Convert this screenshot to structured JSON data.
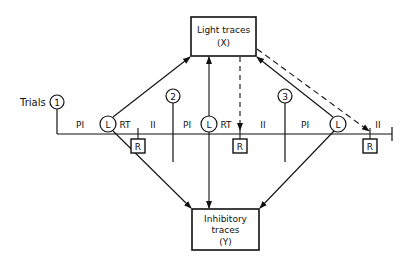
{
  "diagram": {
    "boxes": {
      "light": {
        "line1": "Light traces",
        "line2": "(X)"
      },
      "inhibitory": {
        "line1": "Inhibitory",
        "line2": "traces",
        "line3": "(Y)"
      }
    },
    "trials_label": "Trials",
    "trial_numbers": [
      "1",
      "2",
      "3"
    ],
    "light_marker": "L",
    "response_marker": "R",
    "interval_labels": {
      "pi": "PI",
      "rt": "RT",
      "ii": "II"
    }
  }
}
